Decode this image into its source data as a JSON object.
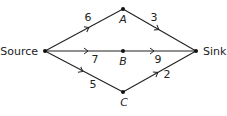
{
  "diagram": {
    "type": "flow-network",
    "nodes": [
      {
        "id": "source",
        "label": "Source",
        "x": 45,
        "y": 51
      },
      {
        "id": "A",
        "label": "A",
        "x": 123,
        "y": 9
      },
      {
        "id": "B",
        "label": "B",
        "x": 123,
        "y": 51
      },
      {
        "id": "C",
        "label": "C",
        "x": 123,
        "y": 92
      },
      {
        "id": "sink",
        "label": "Sink",
        "x": 196,
        "y": 51
      }
    ],
    "edges": [
      {
        "from": "source",
        "to": "A",
        "weight": "6"
      },
      {
        "from": "A",
        "to": "sink",
        "weight": "3"
      },
      {
        "from": "source",
        "to": "B",
        "weight": "7"
      },
      {
        "from": "B",
        "to": "sink",
        "weight": "9"
      },
      {
        "from": "source",
        "to": "C",
        "weight": "5"
      },
      {
        "from": "C",
        "to": "sink",
        "weight": "2"
      }
    ]
  },
  "labels": {
    "source": "Source",
    "sink": "Sink",
    "A": "A",
    "B": "B",
    "C": "C",
    "w_source_A": "6",
    "w_A_sink": "3",
    "w_source_B": "7",
    "w_B_sink": "9",
    "w_source_C": "5",
    "w_C_sink": "2"
  }
}
